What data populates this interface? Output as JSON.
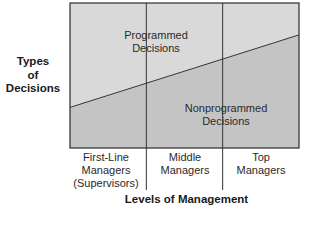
{
  "diagram": {
    "y_axis_label": [
      "Types",
      "of",
      "Decisions"
    ],
    "x_axis_label": "Levels of Management",
    "regions": {
      "upper": {
        "label": [
          "Programmed",
          "Decisions"
        ],
        "color": "#d9d9d9"
      },
      "lower": {
        "label": [
          "Nonprogrammed",
          "Decisions"
        ],
        "color": "#c4c4c4"
      }
    },
    "categories": [
      {
        "lines": [
          "First-Line",
          "Managers",
          "(Supervisors)"
        ]
      },
      {
        "lines": [
          "Middle",
          "Managers"
        ]
      },
      {
        "lines": [
          "Top",
          "Managers"
        ]
      }
    ],
    "divider_fraction": {
      "start": 0.28,
      "end": 0.78
    },
    "colors": {
      "border": "#2b2b2b",
      "line": "#333333"
    }
  }
}
